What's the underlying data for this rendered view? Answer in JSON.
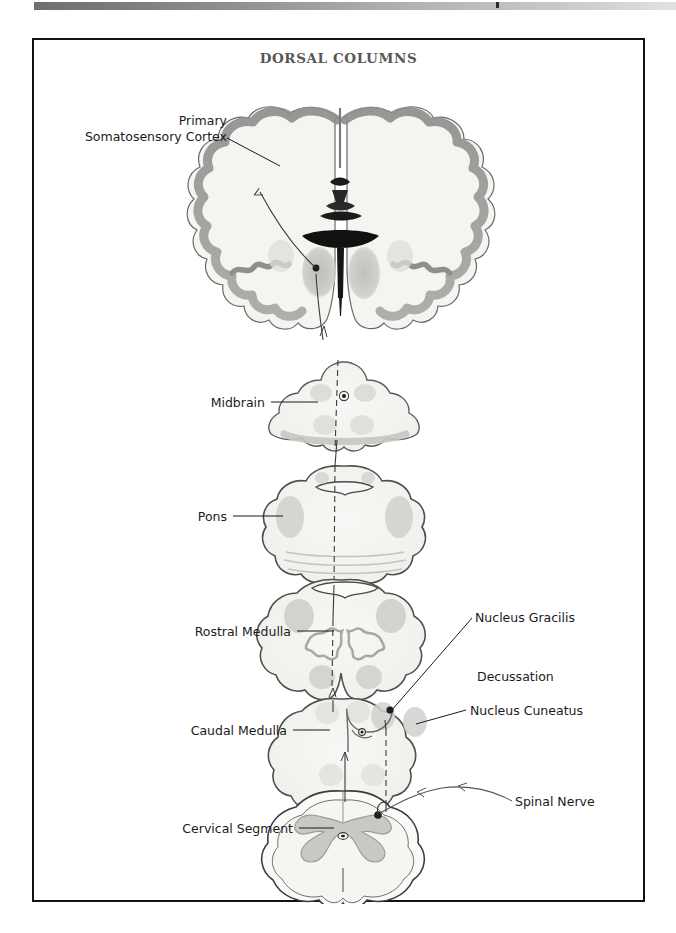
{
  "page": {
    "background_color": "#ffffff",
    "frame_border_color": "#121212",
    "scan_artifact": "gradient-band"
  },
  "figure": {
    "title": "DORSAL COLUMNS",
    "title_color": "#575757",
    "type": "anatomical-pathway-diagram"
  },
  "labels": [
    {
      "id": "primary-somatosensory-cortex",
      "line1": "Primary",
      "line2": "Somatosensory Cortex",
      "align": "right",
      "leader": true
    },
    {
      "id": "midbrain",
      "text": "Midbrain",
      "align": "right",
      "leader": true
    },
    {
      "id": "pons",
      "text": "Pons",
      "align": "right",
      "leader": true
    },
    {
      "id": "rostral-medulla",
      "text": "Rostral Medulla",
      "align": "right",
      "leader": true
    },
    {
      "id": "caudal-medulla",
      "text": "Caudal Medulla",
      "align": "right",
      "leader": true
    },
    {
      "id": "cervical-segment",
      "text": "Cervical Segment",
      "align": "right",
      "leader": true
    },
    {
      "id": "nucleus-gracilis",
      "text": "Nucleus Gracilis",
      "align": "left",
      "leader": true
    },
    {
      "id": "nucleus-cuneatus",
      "text": "Nucleus Cuneatus",
      "align": "left",
      "leader": true
    },
    {
      "id": "decussation",
      "text": "Decussation",
      "align": "left",
      "leader": false
    },
    {
      "id": "spinal-nerve",
      "text": "Spinal Nerve",
      "align": "left",
      "leader": true
    }
  ],
  "sections": [
    {
      "id": "cerebrum",
      "name": "coronal-brain-section",
      "label_ref": "primary-somatosensory-cortex"
    },
    {
      "id": "midbrain",
      "name": "midbrain-section",
      "label_ref": "midbrain"
    },
    {
      "id": "pons",
      "name": "pons-section",
      "label_ref": "pons"
    },
    {
      "id": "rostral-medulla",
      "name": "rostral-medulla-section",
      "label_ref": "rostral-medulla"
    },
    {
      "id": "caudal-medulla",
      "name": "caudal-medulla-section",
      "label_ref": "caudal-medulla"
    },
    {
      "id": "cervical-cord",
      "name": "cervical-spinal-cord-section",
      "label_ref": "cervical-segment"
    }
  ],
  "colors": {
    "outline": "#4a4a4a",
    "tissue_fill": "#f3f3f1",
    "gray_matter": "#c9c9c5",
    "cortex_ribbon": "#9a9a98",
    "nucleus": "#bdbdb8",
    "ventricle": "#171717",
    "pathway": "#3a3a3a",
    "label_text": "#1b1b1b"
  }
}
